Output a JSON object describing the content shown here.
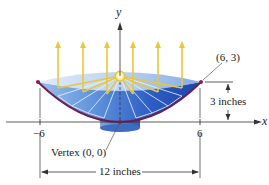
{
  "diagram": {
    "type": "parabolic-reflector",
    "axes": {
      "x_label": "x",
      "y_label": "y"
    },
    "ticks": {
      "left": "−6",
      "right": "6"
    },
    "labels": {
      "point": "(6, 3)",
      "vertex": "Vertex (0, 0)",
      "depth": "3 inches",
      "width": "12 inches"
    },
    "colors": {
      "dish_light": "#cfe0f5",
      "dish_mid": "#6a9be0",
      "dish_dark": "#1f4fb5",
      "parabola": "#6b1f52",
      "rays": "#e8c83a",
      "focus": "#fff7c2",
      "axis": "#333333"
    },
    "ray_count": 6
  }
}
